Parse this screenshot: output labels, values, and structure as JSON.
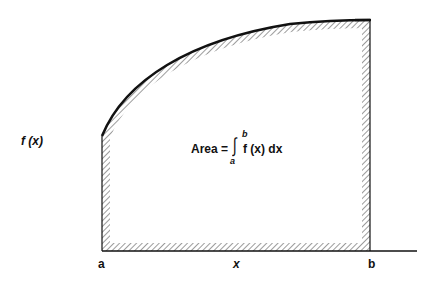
{
  "diagram": {
    "y_axis_label": "f (x)",
    "x_axis_label": "x",
    "lower_limit_label": "a",
    "upper_limit_label": "b",
    "formula": {
      "prefix": "Area =",
      "integral_symbol": "∫",
      "lower": "a",
      "upper": "b",
      "integrand": "f (x) dx"
    },
    "region": {
      "description": "Hatched-border region bounded by curve f(x), vertical lines at a and b, and the x-axis",
      "curve": "increasing, concave down",
      "hatching": "diagonal hatch along inside of boundary"
    },
    "colors": {
      "stroke": "#111111",
      "background": "#ffffff"
    }
  }
}
